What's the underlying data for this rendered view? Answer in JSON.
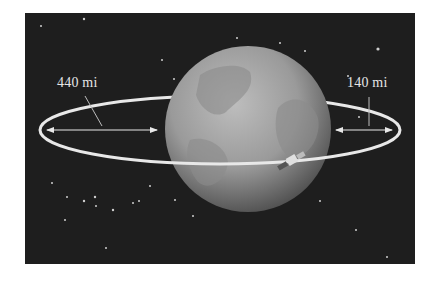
{
  "diagram": {
    "title": "",
    "background_color": "#1e1e1e",
    "globe": {
      "label": "Earth",
      "center": [
        248,
        129
      ],
      "radius": 83,
      "color": "#9a9a9a"
    },
    "orbit": {
      "shape": "ellipse",
      "center": [
        220,
        130
      ],
      "rx": 180,
      "ry": 34,
      "color": "#e8e8e8"
    },
    "satellite": {
      "label": "satellite",
      "position": [
        292,
        160
      ]
    },
    "annotations": [
      {
        "id": "apogee-distance",
        "text": "440 mi",
        "position": [
          57,
          75
        ],
        "arrow_from": [
          47,
          130
        ],
        "arrow_to": [
          157,
          130
        ]
      },
      {
        "id": "perigee-distance",
        "text": "140 mi",
        "position": [
          347,
          75
        ],
        "arrow_from": [
          336,
          130
        ],
        "arrow_to": [
          392,
          130
        ]
      }
    ]
  }
}
